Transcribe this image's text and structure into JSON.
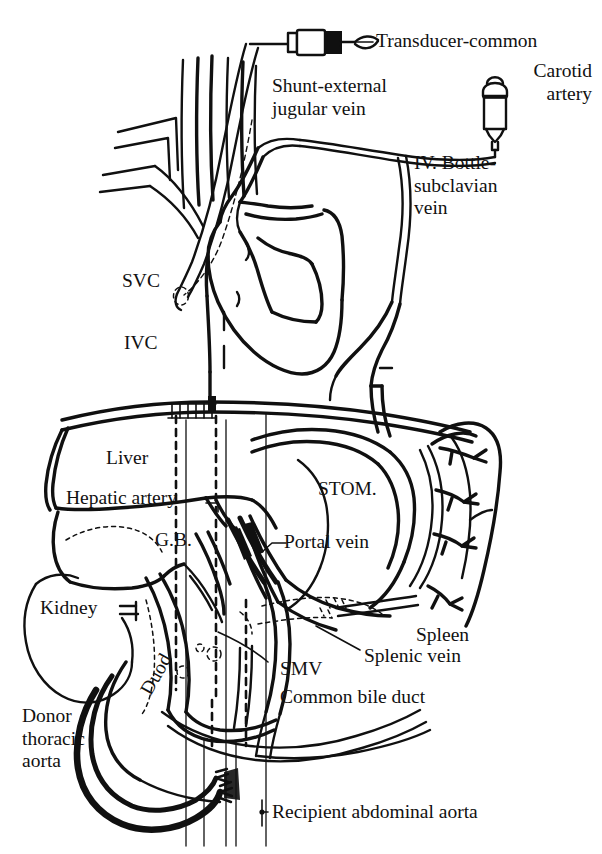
{
  "figure": {
    "kind": "medical-line-diagram",
    "palette": {
      "ink": "#101010",
      "background": "#ffffff"
    }
  },
  "labels": {
    "transducer": "Transducer-common",
    "carotid": "Carotid\nartery",
    "shunt": "Shunt-external\njugular vein",
    "iv_bottle": "IV. Bottle-\nsubclavian\nvein",
    "svc": "SVC",
    "ivc": "IVC",
    "liver": "Liver",
    "hepatic_artery": "Hepatic artery",
    "gall_bladder": "G.B.",
    "stomach": "STOM.",
    "portal_vein": "Portal vein",
    "kidney": "Kidney",
    "duodenum": "Duod",
    "spleen": "Spleen",
    "splenic_vein": "Splenic vein",
    "smv": "SMV",
    "common_bile_duct": "Common bile duct",
    "donor_aorta": "Donor\nthoracic\naorta",
    "recipient_aorta": "Recipient abdominal aorta"
  },
  "devices": [
    {
      "name": "pressure-transducer",
      "label_ref": "transducer"
    },
    {
      "name": "iv-bottle",
      "label_ref": "iv_bottle"
    }
  ],
  "structures": [
    {
      "name": "heart",
      "label_ref": null
    },
    {
      "name": "superior-vena-cava",
      "label_ref": "svc"
    },
    {
      "name": "inferior-vena-cava",
      "label_ref": "ivc"
    },
    {
      "name": "liver",
      "label_ref": "liver"
    },
    {
      "name": "hepatic-artery",
      "label_ref": "hepatic_artery"
    },
    {
      "name": "gall-bladder",
      "label_ref": "gall_bladder"
    },
    {
      "name": "stomach",
      "label_ref": "stomach"
    },
    {
      "name": "portal-vein",
      "label_ref": "portal_vein"
    },
    {
      "name": "kidney",
      "label_ref": "kidney"
    },
    {
      "name": "duodenum",
      "label_ref": "duodenum"
    },
    {
      "name": "spleen",
      "label_ref": "spleen"
    },
    {
      "name": "splenic-vein",
      "label_ref": "splenic_vein"
    },
    {
      "name": "superior-mesenteric-vein",
      "label_ref": "smv"
    },
    {
      "name": "common-bile-duct",
      "label_ref": "common_bile_duct"
    },
    {
      "name": "donor-thoracic-aorta",
      "label_ref": "donor_aorta"
    },
    {
      "name": "recipient-abdominal-aorta",
      "label_ref": "recipient_aorta"
    }
  ]
}
